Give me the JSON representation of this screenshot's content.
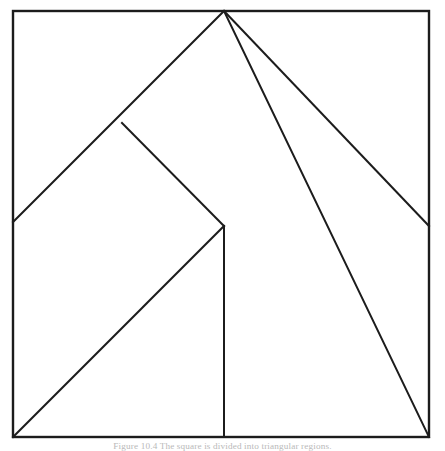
{
  "figure": {
    "background_color": "#ffffff",
    "stroke_color": "#1c1c1c",
    "caption": "Figure 10.4  The square is divided into triangular regions.",
    "caption_color": "#b9b9b9",
    "canvas": {
      "width": 445,
      "height": 451
    },
    "square": {
      "label": "outer-square",
      "left": 13,
      "top": 11,
      "right": 429,
      "bottom": 437
    },
    "points": {
      "top_left": "13,11",
      "top_right": "429,11",
      "bottom_left": "13,437",
      "bottom_right": "429,437",
      "apex": "224,11",
      "left_edge_meet": "13,222",
      "right_edge_meet": "429,226",
      "branch": "122,123",
      "junction": "224,226"
    },
    "segments": [
      {
        "name": "apex-to-left-edge",
        "d": "M 224 11 L 13 222"
      },
      {
        "name": "apex-to-bottom-right-corner",
        "d": "M 224 11 L 429 437"
      },
      {
        "name": "right-edge-tick",
        "d": "M 429 226 L 429 226"
      },
      {
        "name": "branch-to-junction",
        "d": "M 122 123 L 224 226"
      },
      {
        "name": "junction-to-bottom-left-corner",
        "d": "M 224 226 L 13 437"
      },
      {
        "name": "junction-vertical-to-base",
        "d": "M 224 226 L 224 437"
      }
    ]
  }
}
